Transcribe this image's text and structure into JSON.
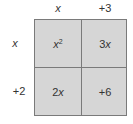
{
  "top_labels": [
    "x",
    "+3"
  ],
  "side_labels": [
    "x",
    "+2"
  ],
  "cells": {
    "top_left": {
      "base": "x",
      "exp": "2"
    },
    "top_right": {
      "coef": "3",
      "var": "x"
    },
    "bottom_left": {
      "coef": "2",
      "var": "x"
    },
    "bottom_right": {
      "text": "+6"
    }
  },
  "colors": {
    "cell_fill": "#d6d6d6",
    "grid_line": "#7a7a7a"
  }
}
